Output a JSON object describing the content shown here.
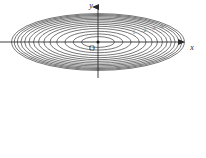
{
  "figure": {
    "origin_label": "O",
    "x_axis_label": "x",
    "y_axis_label": "y",
    "axis_color": "#2b2b2b",
    "contour_color": "#4a4a4a",
    "background_color": "#ffffff",
    "level_labels": [
      "1",
      "2",
      "3",
      "4"
    ]
  },
  "chart_data": {
    "type": "line",
    "title": "",
    "subtitle": "",
    "xlabel": "x",
    "ylabel": "y",
    "grid": false,
    "legend": false,
    "origin": {
      "label": "O",
      "x": 0,
      "y": 0
    },
    "xlim": [
      -4.6,
      4.6
    ],
    "ylim": [
      -1.55,
      1.55
    ],
    "axes": {
      "x_axis": {
        "from_px": 0,
        "to_px": 188,
        "y_px": 42,
        "arrow": true,
        "label": "x"
      },
      "y_axis": {
        "from_px": 4,
        "to_px": 78,
        "x_px": 98,
        "arrow": true,
        "label": "y"
      }
    },
    "curve_family": "ellipse",
    "aspect_ratio_a_over_b": 3.05,
    "curves": [
      {
        "index": 1,
        "semi_axis_x": 0.86,
        "semi_axis_y": 0.28,
        "label": ""
      },
      {
        "index": 2,
        "semi_axis_x": 1.29,
        "semi_axis_y": 0.42,
        "label": ""
      },
      {
        "index": 3,
        "semi_axis_x": 1.72,
        "semi_axis_y": 0.56,
        "label": ""
      },
      {
        "index": 4,
        "semi_axis_x": 2.15,
        "semi_axis_y": 0.7,
        "label": "1"
      },
      {
        "index": 5,
        "semi_axis_x": 2.5,
        "semi_axis_y": 0.82,
        "label": ""
      },
      {
        "index": 6,
        "semi_axis_x": 2.82,
        "semi_axis_y": 0.92,
        "label": "2"
      },
      {
        "index": 7,
        "semi_axis_x": 3.1,
        "semi_axis_y": 1.01,
        "label": ""
      },
      {
        "index": 8,
        "semi_axis_x": 3.36,
        "semi_axis_y": 1.1,
        "label": "3"
      },
      {
        "index": 9,
        "semi_axis_x": 3.6,
        "semi_axis_y": 1.18,
        "label": ""
      },
      {
        "index": 10,
        "semi_axis_x": 3.82,
        "semi_axis_y": 1.25,
        "label": "4"
      },
      {
        "index": 11,
        "semi_axis_x": 4.02,
        "semi_axis_y": 1.32,
        "label": ""
      },
      {
        "index": 12,
        "semi_axis_x": 4.2,
        "semi_axis_y": 1.38,
        "label": ""
      },
      {
        "index": 13,
        "semi_axis_x": 4.36,
        "semi_axis_y": 1.43,
        "label": ""
      },
      {
        "index": 14,
        "semi_axis_x": 4.5,
        "semi_axis_y": 1.48,
        "label": ""
      }
    ]
  }
}
